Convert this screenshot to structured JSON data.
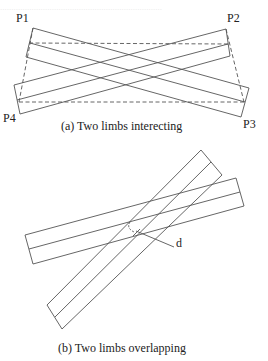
{
  "figure_a": {
    "caption": "(a) Two limbs interecting",
    "points": {
      "p1": "P1",
      "p2": "P2",
      "p3": "P3",
      "p4": "P4"
    }
  },
  "figure_b": {
    "caption": "(b) Two limbs overlapping",
    "annotation": "d"
  },
  "colors": {
    "line": "#555555",
    "text": "#222222",
    "background": "#ffffff"
  }
}
